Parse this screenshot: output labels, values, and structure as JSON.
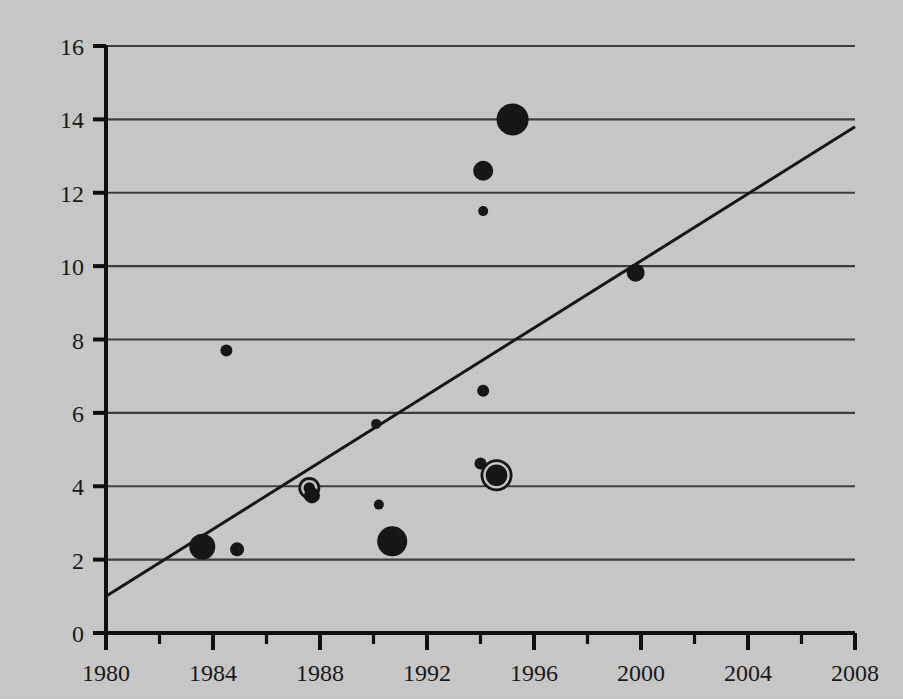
{
  "chart_data": {
    "type": "scatter",
    "title": "",
    "subtitle": "",
    "xlabel": "",
    "ylabel": "",
    "xlim": [
      1980,
      2008
    ],
    "ylim": [
      0,
      16
    ],
    "grid": "horizontal",
    "legend": "none",
    "x_ticks": [
      1980,
      1984,
      1988,
      1992,
      1996,
      2000,
      2004,
      2008
    ],
    "x_tick_labels": [
      "1980",
      "1984",
      "1988",
      "1992",
      "1996",
      "2000",
      "2004",
      "2008"
    ],
    "x_minor_ticks": [
      1982,
      1986,
      1990,
      1994,
      1998,
      2002,
      2006
    ],
    "y_ticks": [
      0,
      2,
      4,
      6,
      8,
      10,
      12,
      14,
      16
    ],
    "y_tick_labels": [
      "0",
      "2",
      "4",
      "6",
      "8",
      "10",
      "12",
      "14",
      "16"
    ],
    "marker_color": "#141414",
    "gridline_color": "#3c3c3c",
    "axis_color": "#0d0d0d",
    "trendline": {
      "label": "",
      "x_start": 1980,
      "y_start": 1.0,
      "x_end": 2008,
      "y_end": 13.8,
      "color": "#141414",
      "width": 3
    },
    "points": [
      {
        "name": "p01",
        "x": 1983.6,
        "y": 2.35,
        "size": 13.0,
        "style": "filled"
      },
      {
        "name": "p02",
        "x": 1984.5,
        "y": 7.7,
        "size": 6.0,
        "style": "filled"
      },
      {
        "name": "p03",
        "x": 1984.9,
        "y": 2.28,
        "size": 7.0,
        "style": "filled"
      },
      {
        "name": "p04",
        "x": 1987.6,
        "y": 3.95,
        "size": 11.0,
        "style": "ringed"
      },
      {
        "name": "p05",
        "x": 1987.7,
        "y": 3.75,
        "size": 8.0,
        "style": "filled"
      },
      {
        "name": "p06",
        "x": 1990.1,
        "y": 5.7,
        "size": 5.0,
        "style": "filled"
      },
      {
        "name": "p07",
        "x": 1990.2,
        "y": 3.5,
        "size": 5.0,
        "style": "filled"
      },
      {
        "name": "p08",
        "x": 1990.7,
        "y": 2.5,
        "size": 15.0,
        "style": "filled"
      },
      {
        "name": "p09",
        "x": 1994.1,
        "y": 11.5,
        "size": 5.0,
        "style": "filled"
      },
      {
        "name": "p10",
        "x": 1994.1,
        "y": 12.6,
        "size": 10.0,
        "style": "filled"
      },
      {
        "name": "p11",
        "x": 1994.1,
        "y": 6.6,
        "size": 6.0,
        "style": "filled"
      },
      {
        "name": "p12",
        "x": 1994.0,
        "y": 4.62,
        "size": 6.0,
        "style": "filled"
      },
      {
        "name": "p13",
        "x": 1994.6,
        "y": 4.3,
        "size": 16.0,
        "style": "ringed"
      },
      {
        "name": "p14",
        "x": 1995.2,
        "y": 14.0,
        "size": 16.0,
        "style": "filled"
      },
      {
        "name": "p15",
        "x": 1999.8,
        "y": 9.82,
        "size": 9.0,
        "style": "filled"
      }
    ]
  },
  "figure": {
    "background_color": "#c9c9c9",
    "plot_left_px": 106,
    "plot_right_px": 855,
    "plot_bottom_px": 633,
    "plot_top_px": 46
  }
}
